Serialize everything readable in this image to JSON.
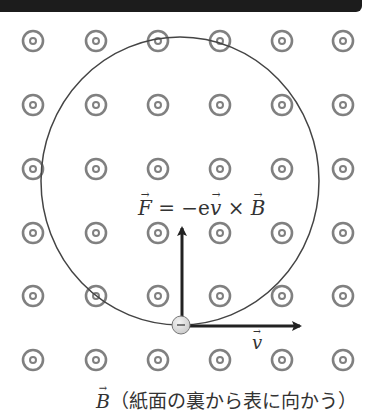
{
  "diagram": {
    "title_bar_color": "#1c1c1c",
    "field_symbol": "dot-in-circle (field out of page)",
    "grid": {
      "columns_x": [
        33,
        96,
        158,
        220,
        282,
        343
      ],
      "rows_y": [
        41,
        105,
        169,
        233,
        296,
        360
      ],
      "symbol_color": "#808080"
    },
    "orbit": {
      "cx": 180,
      "cy": 181,
      "rx": 139,
      "ry": 144,
      "color": "#444444"
    },
    "electron": {
      "x": 181,
      "y": 325,
      "r": 9,
      "sign": "−"
    },
    "force_arrow": {
      "from": [
        182,
        318
      ],
      "to": [
        182,
        228
      ]
    },
    "velocity_arrow": {
      "from": [
        190,
        326
      ],
      "to": [
        300,
        326
      ]
    },
    "labels": {
      "force_lhs": "F",
      "force_eq": " = −e",
      "force_v": "v",
      "force_times": " × ",
      "force_B": "B",
      "velocity": "v",
      "field_B": "B",
      "field_description": "（紙面の裏から表に向かう）"
    }
  }
}
